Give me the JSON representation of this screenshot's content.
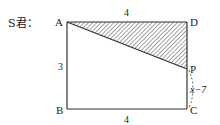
{
  "header": {
    "text": "S君："
  },
  "diagram": {
    "type": "geometry-rectangle",
    "vertices": {
      "A": "A",
      "B": "B",
      "C": "C",
      "D": "D",
      "P": "P"
    },
    "side_labels": {
      "AD": "4",
      "AB": "3",
      "BC": "4",
      "PC": "x−7"
    },
    "shaded_region": "triangle APD",
    "line_color": "#333333",
    "hatch_color": "#444444"
  }
}
